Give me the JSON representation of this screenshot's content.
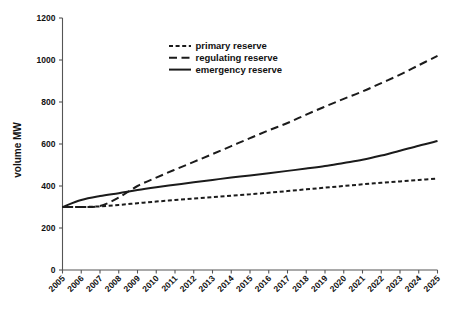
{
  "chart_data": {
    "type": "line",
    "title": "",
    "xlabel": "",
    "ylabel": "volume MW",
    "ylim": [
      0,
      1200
    ],
    "ytick_values": [
      0,
      200,
      400,
      600,
      800,
      1000,
      1200
    ],
    "ytick_labels": [
      "0",
      "200",
      "400",
      "600",
      "800",
      "1000",
      "1200"
    ],
    "xlim": [
      2005,
      2025
    ],
    "grid": false,
    "legend_position": "upper-center",
    "categories": [
      2005,
      2006,
      2007,
      2008,
      2009,
      2010,
      2011,
      2012,
      2013,
      2014,
      2015,
      2016,
      2017,
      2018,
      2019,
      2020,
      2021,
      2022,
      2023,
      2024,
      2025
    ],
    "xtick_labels": [
      "2005",
      "2006",
      "2007",
      "2008",
      "2009",
      "2010",
      "2011",
      "2012",
      "2013",
      "2014",
      "2015",
      "2016",
      "2017",
      "2018",
      "2019",
      "2020",
      "2021",
      "2022",
      "2023",
      "2024",
      "2025"
    ],
    "series": [
      {
        "name": "primary reserve",
        "style": "short-dash",
        "color": "#1b1b1b",
        "values": [
          300,
          300,
          303,
          310,
          318,
          326,
          333,
          340,
          347,
          354,
          361,
          368,
          376,
          384,
          392,
          400,
          408,
          415,
          422,
          429,
          435
        ]
      },
      {
        "name": "regulating reserve",
        "style": "long-dash",
        "color": "#1b1b1b",
        "values": [
          300,
          300,
          305,
          345,
          400,
          440,
          478,
          515,
          552,
          590,
          628,
          665,
          700,
          740,
          778,
          815,
          850,
          890,
          930,
          975,
          1020
        ]
      },
      {
        "name": "emergency reserve",
        "style": "solid",
        "color": "#1b1b1b",
        "values": [
          300,
          333,
          352,
          366,
          381,
          394,
          406,
          418,
          429,
          440,
          450,
          461,
          472,
          483,
          495,
          510,
          525,
          545,
          568,
          592,
          614
        ]
      }
    ]
  },
  "legend": {
    "items": [
      {
        "label": "primary reserve",
        "style": "short-dash"
      },
      {
        "label": "regulating reserve",
        "style": "long-dash"
      },
      {
        "label": "emergency reserve",
        "style": "solid"
      }
    ]
  },
  "axes": {
    "y_title": "volume MW"
  }
}
